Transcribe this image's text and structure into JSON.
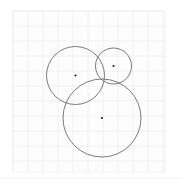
{
  "figure": {
    "title": "",
    "width": 182,
    "height": 186,
    "background_color": "#ffffff",
    "caption": ""
  },
  "plot_area": {
    "x": 13,
    "y": 11,
    "width": 152,
    "height": 161,
    "background_color": "#fdfdfd",
    "border_color": "#f2f2f2"
  },
  "grid": {
    "visible": true,
    "spacing": 15,
    "color": "#f0f0f0",
    "line_width": 1,
    "major_color": "#ebebeb"
  },
  "baseline": {
    "visible": true,
    "y": 178,
    "color": "#f0f0f0"
  },
  "chart_data": {
    "type": "scatter",
    "title": "",
    "subtitle": "",
    "xlabel": "",
    "ylabel": "",
    "xlim": [
      0,
      152
    ],
    "ylim": [
      0,
      161
    ],
    "grid": true,
    "legend": "none",
    "annotations": [],
    "shapes": [
      {
        "name": "circle-upper-left",
        "type": "circle",
        "cx": 75.5,
        "cy": 75.5,
        "r": 29,
        "stroke": "#6b6b6b",
        "stroke_width": 0.9,
        "fill": "none"
      },
      {
        "name": "circle-top-right",
        "type": "circle",
        "cx": 113.5,
        "cy": 66,
        "r": 18,
        "stroke": "#6b6b6b",
        "stroke_width": 0.9,
        "fill": "none"
      },
      {
        "name": "circle-bottom",
        "type": "circle",
        "cx": 102,
        "cy": 118,
        "r": 39,
        "stroke": "#6b6b6b",
        "stroke_width": 0.9,
        "fill": "none"
      }
    ],
    "points": [
      {
        "name": "center-upper-left",
        "x": 75.5,
        "y": 75.5,
        "marker": "dot",
        "size": 2.1,
        "color": "#1a1a1a"
      },
      {
        "name": "center-top-right",
        "x": 113.5,
        "y": 66,
        "marker": "dot",
        "size": 2.1,
        "color": "#1a1a1a"
      },
      {
        "name": "center-bottom",
        "x": 102,
        "y": 118,
        "marker": "dot",
        "size": 2.1,
        "color": "#1a1a1a"
      }
    ]
  }
}
